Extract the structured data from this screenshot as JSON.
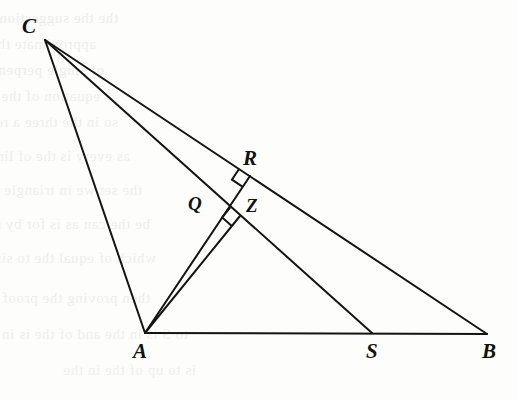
{
  "figure": {
    "width": 518,
    "height": 401,
    "background_color": "#fdfdfc",
    "stroke_color": "#141414",
    "stroke_width": 2,
    "label_color": "#111111"
  },
  "points": {
    "C": {
      "label": "C",
      "x": 45,
      "y": 40,
      "label_x": 22,
      "label_y": 16
    },
    "A": {
      "label": "A",
      "x": 145,
      "y": 333,
      "label_x": 133,
      "label_y": 341
    },
    "B": {
      "label": "B",
      "x": 487,
      "y": 334,
      "label_x": 482,
      "label_y": 341
    },
    "S": {
      "label": "S",
      "x": 372,
      "y": 333,
      "label_x": 366,
      "label_y": 341
    },
    "R": {
      "label": "R",
      "x": 250,
      "y": 176,
      "label_x": 243,
      "label_y": 148
    },
    "Q": {
      "label": "Q",
      "x": 212,
      "y": 213,
      "label_x": 188,
      "label_y": 194
    },
    "Z": {
      "label": "Z",
      "x": 240,
      "y": 216,
      "label_x": 246,
      "label_y": 196
    }
  },
  "segments": [
    {
      "name": "CA",
      "from": "C",
      "to": "A"
    },
    {
      "name": "CB",
      "from": "C",
      "to": "B"
    },
    {
      "name": "CS",
      "from": "C",
      "to": "S"
    },
    {
      "name": "AB",
      "from": "A",
      "to": "B"
    },
    {
      "name": "AR",
      "from": "A",
      "to": "R"
    },
    {
      "name": "AZ",
      "from": "A",
      "to": "Z"
    }
  ],
  "right_angles": [
    {
      "name": "right-angle-at-R",
      "vertex": "R",
      "on_segment": "CB",
      "perpendicular_segment": "AR",
      "size": 13
    },
    {
      "name": "right-angle-at-Z",
      "vertex": "Z",
      "on_segment": "CS",
      "perpendicular_segment": "AZ",
      "size": 13
    }
  ],
  "ghost_text": [
    {
      "text": "the the suggestion is to the all the of",
      "x": 118,
      "y": 10,
      "size": 15,
      "opacity": 0.45
    },
    {
      "text": "approximate that is recognized as",
      "x": 96,
      "y": 36,
      "size": 15,
      "opacity": 0.42
    },
    {
      "text": "of single perpendicular. Then the the",
      "x": 104,
      "y": 62,
      "size": 15,
      "opacity": 0.45
    },
    {
      "text": "equation of the is of the region area a",
      "x": 100,
      "y": 88,
      "size": 15,
      "opacity": 0.42
    },
    {
      "text": "so in the three a result of",
      "x": 118,
      "y": 114,
      "size": 15,
      "opacity": 0.4
    },
    {
      "text": "as every is the of line A. below",
      "x": 130,
      "y": 148,
      "size": 15,
      "opacity": 0.42
    },
    {
      "text": "the set we in triangle and the",
      "x": 142,
      "y": 182,
      "size": 15,
      "opacity": 0.4
    },
    {
      "text": "be the can as is for by similar",
      "x": 150,
      "y": 216,
      "size": 15,
      "opacity": 0.42
    },
    {
      "text": "which of equal the to since the",
      "x": 156,
      "y": 250,
      "size": 15,
      "opacity": 0.4
    },
    {
      "text": "then proving the proof of the the of",
      "x": 150,
      "y": 290,
      "size": 15,
      "opacity": 0.42
    },
    {
      "text": "to S is in the and of the is in a",
      "x": 188,
      "y": 326,
      "size": 15,
      "opacity": 0.4
    },
    {
      "text": "is to up of the in the",
      "x": 196,
      "y": 362,
      "size": 15,
      "opacity": 0.38
    }
  ]
}
